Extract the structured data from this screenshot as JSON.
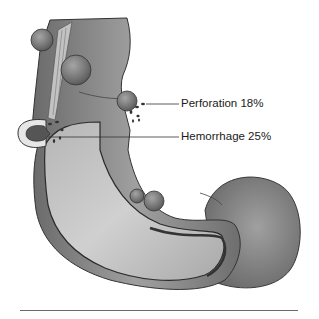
{
  "figure": {
    "colors": {
      "wall_dark": "#5f5f5f",
      "wall_mid": "#8a8a8a",
      "wall_light": "#b9b9b9",
      "lumen": "#c8c8c8",
      "diverticulum": "#777777",
      "outline": "#2b2b2b",
      "blood": "#3a3a3a"
    }
  },
  "callouts": [
    {
      "label": "Perforation 18%"
    },
    {
      "label": "Hemorrhage 25%"
    }
  ]
}
